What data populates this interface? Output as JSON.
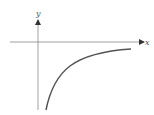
{
  "diagram": {
    "type": "function-graph",
    "axes": {
      "x_label": "x",
      "y_label": "y"
    },
    "curve": {
      "description": "increasing concave curve approaching the x-axis from below as x grows (asymptotic to y=0)",
      "color": "#555555"
    },
    "colors": {
      "axis": "#777777",
      "curve": "#555555",
      "background": "#ffffff"
    }
  }
}
